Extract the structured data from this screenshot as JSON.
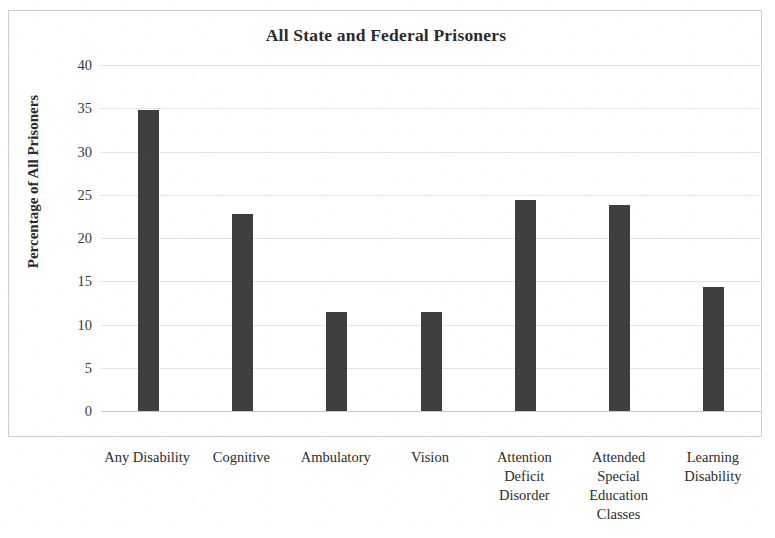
{
  "chart_data": {
    "type": "bar",
    "title": "All State and Federal Prisoners",
    "xlabel": "",
    "ylabel": "Percentage of All Prisoners",
    "ylim": [
      0,
      40
    ],
    "ytick_step": 5,
    "yticks": [
      "40",
      "35",
      "30",
      "25",
      "20",
      "15",
      "10",
      "5",
      "0"
    ],
    "grid": true,
    "legend": "none",
    "bar_color": "#3f3f3f",
    "gridline_color": "#e3e3e3",
    "frame_color": "#cfcfcf",
    "categories": [
      "Any Disability",
      "Cognitive",
      "Ambulatory",
      "Vision",
      "Attention Deficit Disorder",
      "Attended Special Education Classes",
      "Learning Disability"
    ],
    "category_lines": [
      [
        "Any Disability"
      ],
      [
        "Cognitive"
      ],
      [
        "Ambulatory"
      ],
      [
        "Vision"
      ],
      [
        "Attention",
        "Deficit",
        "Disorder"
      ],
      [
        "Attended",
        "Special",
        "Education",
        "Classes"
      ],
      [
        "Learning",
        "Disability"
      ]
    ],
    "values": [
      34.8,
      22.8,
      11.5,
      11.5,
      24.4,
      23.8,
      14.3
    ]
  }
}
